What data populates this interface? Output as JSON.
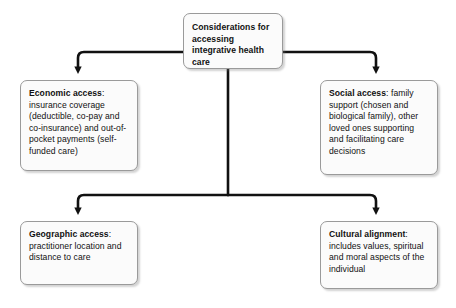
{
  "diagram": {
    "type": "flowchart",
    "orientation": "top-down-branching",
    "root": {
      "id": "considerations",
      "title": "Considerations for accessing integrative health care",
      "text": "Considerations for accessing integrative health care",
      "bold": true
    },
    "branches": [
      {
        "id": "economic-access",
        "label": "Economic access",
        "separator": ":",
        "body": "insurance coverage (deductible, co-pay and co-insurance) and out-of-pocket payments (self-funded care)",
        "position": "top-left"
      },
      {
        "id": "social-access",
        "label": "Social access",
        "separator": ":",
        "body": "family support (chosen and biological family), other loved ones supporting and facilitating care decisions",
        "position": "top-right"
      },
      {
        "id": "geographic-access",
        "label": "Geographic access",
        "separator": ":",
        "body": "practitioner location and distance to care",
        "position": "bottom-left"
      },
      {
        "id": "cultural-alignment",
        "label": "Cultural alignment",
        "separator": ":",
        "body": "includes values, spiritual and moral aspects of the individual",
        "position": "bottom-right"
      }
    ],
    "connectors": [
      {
        "name": "root-to-economic",
        "style": "elbow-with-arrowhead"
      },
      {
        "name": "root-to-social",
        "style": "elbow-with-arrowhead"
      },
      {
        "name": "root-to-geographic",
        "style": "elbow-with-arrowhead"
      },
      {
        "name": "root-to-cultural",
        "style": "elbow-with-arrowhead"
      }
    ],
    "colors": {
      "background": "#ffffff",
      "node_fill": "#fbfbfb",
      "node_border": "#9a9a9a",
      "connector": "#111111",
      "text": "#111111"
    }
  }
}
